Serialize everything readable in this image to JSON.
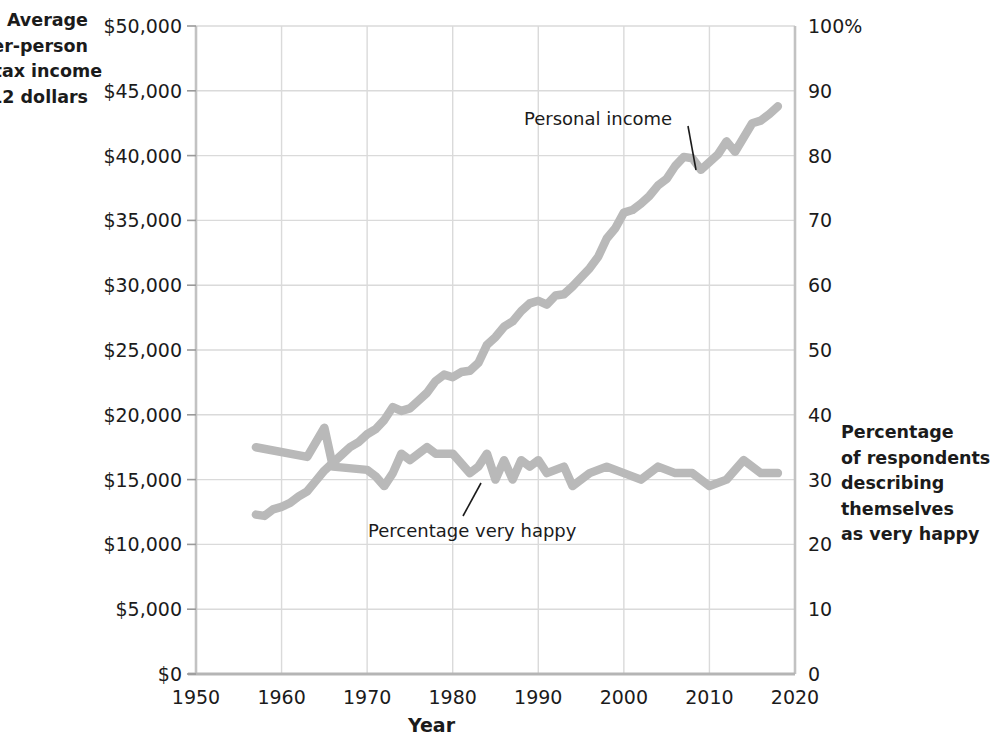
{
  "captions": {
    "left_axis": "Average\nper-person\nafter-tax income\nin 2012 dollars",
    "right_axis": "Percentage\nof respondents\ndescribing\nthemselves\nas very happy"
  },
  "chart_data": {
    "type": "line",
    "title": "",
    "xlabel": "Year",
    "ylabel": "Average per-person after-tax income in 2012 dollars",
    "y2label": "Percentage of respondents describing themselves as very happy",
    "xlim": [
      1950,
      2020
    ],
    "ylim": [
      0,
      50000
    ],
    "y2lim": [
      0,
      100
    ],
    "grid": true,
    "legend_position": "inline-annotations",
    "xticks": [
      1950,
      1960,
      1970,
      1980,
      1990,
      2000,
      2010,
      2020
    ],
    "xticklabels": [
      "1950",
      "1960",
      "1970",
      "1980",
      "1990",
      "2000",
      "2010",
      "2020"
    ],
    "yticks": [
      0,
      5000,
      10000,
      15000,
      20000,
      25000,
      30000,
      35000,
      40000,
      45000,
      50000
    ],
    "yticklabels": [
      "$0",
      "$5,000",
      "$10,000",
      "$15,000",
      "$20,000",
      "$25,000",
      "$30,000",
      "$35,000",
      "$40,000",
      "$45,000",
      "$50,000"
    ],
    "y2ticks": [
      0,
      10,
      20,
      30,
      40,
      50,
      60,
      70,
      80,
      90,
      100
    ],
    "y2ticklabels": [
      "0",
      "10",
      "20",
      "30",
      "40",
      "50",
      "60",
      "70",
      "80",
      "90",
      "100%"
    ],
    "series": [
      {
        "name": "Personal income",
        "axis": "left",
        "color": "#b9b9b9",
        "x": [
          1957,
          1958,
          1959,
          1960,
          1961,
          1962,
          1963,
          1964,
          1965,
          1966,
          1967,
          1968,
          1969,
          1970,
          1971,
          1972,
          1973,
          1974,
          1975,
          1976,
          1977,
          1978,
          1979,
          1980,
          1981,
          1982,
          1983,
          1984,
          1985,
          1986,
          1987,
          1988,
          1989,
          1990,
          1991,
          1992,
          1993,
          1994,
          1995,
          1996,
          1997,
          1998,
          1999,
          2000,
          2001,
          2002,
          2003,
          2004,
          2005,
          2006,
          2007,
          2008,
          2009,
          2010,
          2011,
          2012,
          2013,
          2014,
          2015,
          2016,
          2017,
          2018
        ],
        "values": [
          12300,
          12200,
          12700,
          12900,
          13200,
          13700,
          14100,
          14900,
          15700,
          16300,
          16900,
          17500,
          17900,
          18500,
          18900,
          19600,
          20600,
          20300,
          20500,
          21100,
          21700,
          22600,
          23100,
          22900,
          23300,
          23400,
          24000,
          25400,
          26000,
          26800,
          27200,
          28000,
          28600,
          28800,
          28500,
          29200,
          29300,
          29900,
          30600,
          31300,
          32200,
          33600,
          34400,
          35600,
          35800,
          36300,
          36900,
          37700,
          38200,
          39200,
          39900,
          39800,
          38900,
          39500,
          40100,
          41100,
          40300,
          41400,
          42500,
          42700,
          43200,
          43800
        ]
      },
      {
        "name": "Percentage very happy",
        "axis": "right",
        "color": "#b9b9b9",
        "x": [
          1957,
          1963,
          1965,
          1966,
          1970,
          1971,
          1972,
          1973,
          1974,
          1975,
          1976,
          1977,
          1978,
          1980,
          1982,
          1983,
          1984,
          1985,
          1986,
          1987,
          1988,
          1989,
          1990,
          1991,
          1993,
          1994,
          1996,
          1998,
          2000,
          2002,
          2004,
          2006,
          2008,
          2010,
          2012,
          2014,
          2016,
          2018
        ],
        "values": [
          35,
          33.5,
          38,
          32,
          31.5,
          30.5,
          29,
          31,
          34,
          33,
          34,
          35,
          34,
          34,
          31,
          32,
          34,
          30,
          33,
          30,
          33,
          32,
          33,
          31,
          32,
          29,
          31,
          32,
          31,
          30,
          32,
          31,
          31,
          29,
          30,
          33,
          31,
          31
        ]
      }
    ],
    "annotations": [
      {
        "text": "Personal income",
        "x": 524,
        "y": 108,
        "leader_to_x": 692,
        "leader_to_y": 166
      },
      {
        "text": "Percentage very happy",
        "x": 368,
        "y": 520,
        "leader_to_x": 476,
        "leader_to_y": 484
      }
    ]
  }
}
